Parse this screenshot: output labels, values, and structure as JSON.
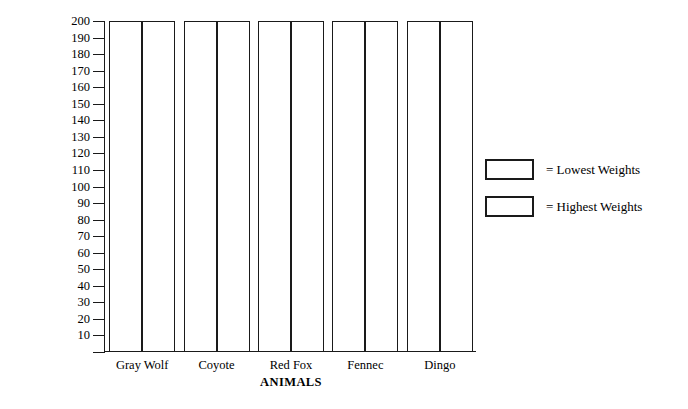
{
  "chart_data": {
    "type": "bar",
    "title": "",
    "xlabel": "ANIMALS",
    "ylabel": "Weight in Pounds",
    "categories": [
      "Gray Wolf",
      "Coyote",
      "Red Fox",
      "Fennec",
      "Dingo"
    ],
    "series": [
      {
        "name": "Lowest Weights",
        "values": [
          200,
          200,
          200,
          200,
          200
        ]
      },
      {
        "name": "Highest Weights",
        "values": [
          200,
          200,
          200,
          200,
          200
        ]
      }
    ],
    "ylim": [
      0,
      200
    ],
    "ytick_step": 10,
    "yticks": [
      200,
      190,
      180,
      170,
      160,
      150,
      140,
      130,
      120,
      110,
      100,
      90,
      80,
      70,
      60,
      50,
      40,
      30,
      20,
      10
    ],
    "grid": false,
    "legend_position": "right",
    "legend": [
      {
        "label": "= Lowest Weights",
        "swatch_fill": "#ffffff",
        "swatch_stroke": "#1a1a1a"
      },
      {
        "label": "= Highest Weights",
        "swatch_fill": "#ffffff",
        "swatch_stroke": "#1a1a1a"
      }
    ],
    "colors": {
      "background": "#ffffff",
      "axis": "#1a1a1a",
      "bar_fill": "#ffffff",
      "bar_stroke": "#1a1a1a",
      "text": "#000000"
    }
  }
}
